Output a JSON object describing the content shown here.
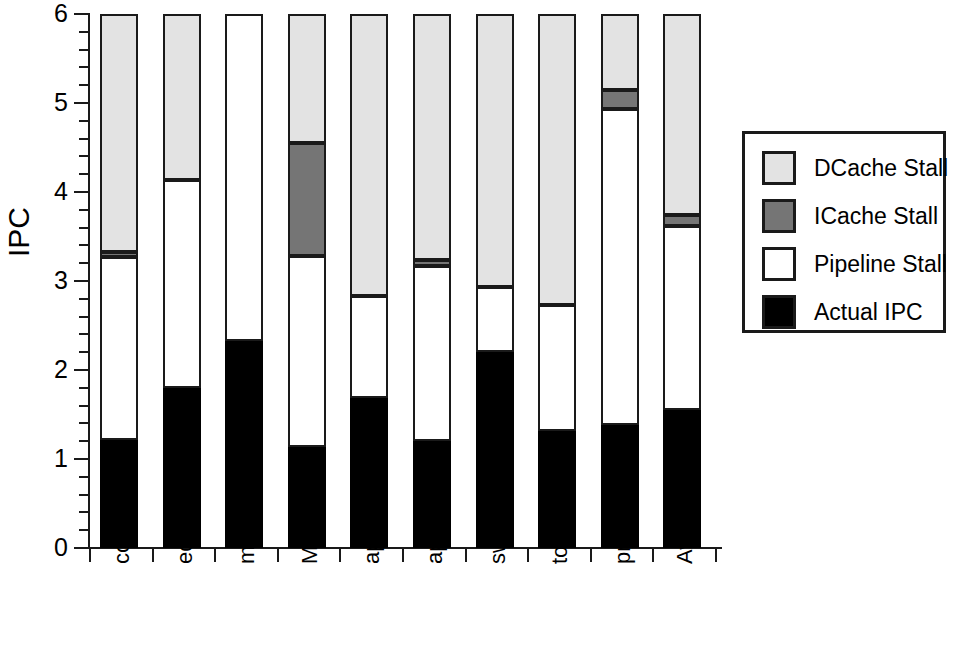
{
  "chart_data": {
    "type": "bar",
    "title": "",
    "subtitle": "",
    "xlabel": "",
    "ylabel": "IPC",
    "ylim": [
      0,
      6
    ],
    "ytick_labels": [
      "0",
      "1",
      "2",
      "3",
      "4",
      "5",
      "6"
    ],
    "ytick_values": [
      0,
      1,
      2,
      3,
      4,
      5,
      6
    ],
    "yminor_step": 0.2,
    "grid": false,
    "stacked": true,
    "legend_position": "right",
    "categories": [
      "compress",
      "eqntott",
      "m88ksim",
      "MPsim",
      "applu",
      "apsi",
      "swim",
      "tomcatv",
      "pmake",
      "Average"
    ],
    "series": [
      {
        "name": "Actual IPC",
        "color": "#000000",
        "values": [
          1.21,
          1.8,
          2.33,
          1.14,
          1.68,
          1.2,
          2.2,
          1.31,
          1.38,
          1.55
        ]
      },
      {
        "name": "Pipeline Stall",
        "color": "#ffffff",
        "values": [
          2.06,
          2.34,
          3.67,
          2.14,
          1.15,
          1.97,
          0.73,
          1.42,
          3.55,
          2.07
        ]
      },
      {
        "name": "ICache Stall",
        "color": "#757575",
        "values": [
          0.06,
          0.0,
          0.0,
          1.27,
          0.0,
          0.07,
          0.0,
          0.0,
          0.22,
          0.12
        ]
      },
      {
        "name": "DCache Stall",
        "color": "#e3e3e3",
        "values": [
          2.67,
          1.86,
          0.0,
          1.45,
          3.17,
          2.76,
          3.07,
          3.27,
          0.85,
          2.26
        ]
      }
    ],
    "cumulative_tops": {
      "actual_ipc": [
        1.21,
        1.8,
        2.33,
        1.14,
        1.68,
        1.2,
        2.2,
        1.31,
        1.38,
        1.55
      ],
      "pipeline_stall": [
        3.27,
        4.14,
        6.0,
        3.28,
        2.83,
        3.17,
        2.93,
        2.73,
        4.93,
        3.62
      ],
      "icache_stall": [
        3.33,
        4.14,
        6.0,
        4.55,
        2.83,
        3.24,
        2.93,
        2.73,
        5.15,
        3.74
      ],
      "dcache_stall": [
        6.0,
        6.0,
        6.0,
        6.0,
        6.0,
        6.0,
        6.0,
        6.0,
        6.0,
        6.0
      ]
    }
  },
  "legend": {
    "entries": [
      {
        "label": "DCache Stall",
        "swatch_color": "#e3e3e3",
        "icon": "legend-swatch-dcache"
      },
      {
        "label": "ICache Stall",
        "swatch_color": "#757575",
        "icon": "legend-swatch-icache"
      },
      {
        "label": "Pipeline Stall",
        "swatch_color": "#ffffff",
        "icon": "legend-swatch-pipeline"
      },
      {
        "label": "Actual IPC",
        "swatch_color": "#000000",
        "icon": "legend-swatch-actual"
      }
    ]
  },
  "axes": {
    "y_title": "IPC",
    "y_ticks": [
      "6",
      "5",
      "4",
      "3",
      "2",
      "1",
      "0"
    ]
  }
}
